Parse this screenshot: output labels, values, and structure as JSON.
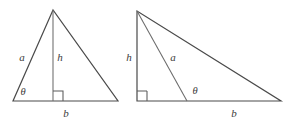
{
  "figure": {
    "background_color": "#ffffff",
    "stroke_color": "#4a4a4a",
    "label_color": "#3c3c3c",
    "left_diagram": {
      "name": "isosceles-triangle-with-altitude",
      "labels": {
        "side_a": "a",
        "height_h": "h",
        "angle_theta": "θ",
        "base_b": "b"
      },
      "geometry": {
        "apex": [
          53,
          10
        ],
        "base_left": [
          13,
          101
        ],
        "base_right": [
          118,
          101
        ],
        "foot_of_altitude": [
          53,
          101
        ],
        "right_angle_marker": "square-at-foot-of-altitude"
      }
    },
    "right_diagram": {
      "name": "right-triangle-with-interior-segment",
      "labels": {
        "height_h": "h",
        "side_a": "a",
        "angle_theta": "θ",
        "base_b": "b"
      },
      "geometry": {
        "apex": [
          137,
          11
        ],
        "base_left": [
          137,
          101
        ],
        "base_right": [
          281,
          101
        ],
        "segment_foot": [
          187,
          101
        ],
        "right_angle_marker": "square-at-base-left-corner"
      }
    }
  }
}
